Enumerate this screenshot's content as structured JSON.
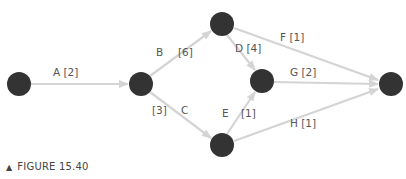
{
  "colors": {
    "node": "#333333",
    "edge": "#d4d4d4",
    "label": "#555555"
  },
  "nodes": [
    {
      "id": "n1",
      "x": 19,
      "y": 84
    },
    {
      "id": "n2",
      "x": 141,
      "y": 84
    },
    {
      "id": "n3",
      "x": 222,
      "y": 24
    },
    {
      "id": "n4",
      "x": 262,
      "y": 81
    },
    {
      "id": "n5",
      "x": 222,
      "y": 145
    },
    {
      "id": "n6",
      "x": 391,
      "y": 84
    }
  ],
  "edges": [
    {
      "from": "n1",
      "to": "n2",
      "label": "A [2]"
    },
    {
      "from": "n2",
      "to": "n3",
      "label": "B [6]"
    },
    {
      "from": "n2",
      "to": "n5",
      "label": "C [3]"
    },
    {
      "from": "n3",
      "to": "n4",
      "label": "D [4]"
    },
    {
      "from": "n5",
      "to": "n4",
      "label": "E [1]"
    },
    {
      "from": "n3",
      "to": "n6",
      "label": "F [1]"
    },
    {
      "from": "n4",
      "to": "n6",
      "label": "G [2]"
    },
    {
      "from": "n5",
      "to": "n6",
      "label": "H [1]"
    }
  ],
  "labels": {
    "A": "A [2]",
    "B": "B",
    "B_dur": "[6]",
    "C": "C",
    "C_dur": "[3]",
    "D": "D [4]",
    "E": "E",
    "E_dur": "[1]",
    "F": "F [1]",
    "G": "G [2]",
    "H": "H [1]"
  },
  "caption": {
    "marker": "▲",
    "text": "FIGURE 15.40"
  }
}
